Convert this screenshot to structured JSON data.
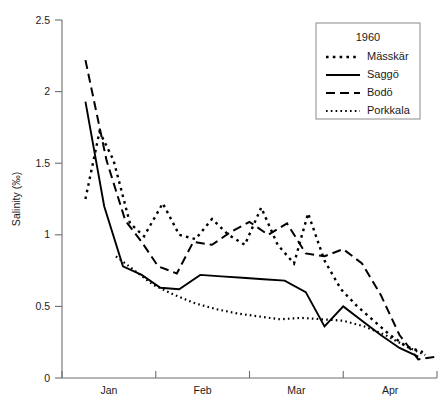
{
  "chart_data": {
    "type": "line",
    "title": "",
    "xlabel": "",
    "ylabel": "Salinity (‰)",
    "ylim": [
      0,
      2.5
    ],
    "yticks": [
      "0",
      "0.5",
      "1",
      "1.5",
      "2",
      "2.5"
    ],
    "ytick_values": [
      0,
      0.5,
      1,
      1.5,
      2,
      2.5
    ],
    "xlim": [
      0,
      16
    ],
    "xtick_labels": [
      "Jan",
      "Feb",
      "Mar",
      "Apr"
    ],
    "xtick_positions": [
      2,
      6,
      10,
      14
    ],
    "xtick_boundaries": [
      0,
      4,
      8,
      12,
      16
    ],
    "grid": false,
    "legend_position": "top-right",
    "legend_title": "1960",
    "series": [
      {
        "name": "Mässkär",
        "style": "dotted-coarse",
        "x": [
          1.0,
          1.6,
          2.2,
          2.9,
          3.5,
          4.3,
          5.0,
          5.7,
          6.4,
          7.1,
          7.8,
          8.5,
          9.2,
          9.9,
          10.5,
          11.2,
          11.9,
          12.6,
          13.3,
          14.0,
          14.7,
          15.4
        ],
        "values": [
          1.25,
          1.72,
          1.52,
          1.08,
          0.99,
          1.22,
          1.0,
          0.97,
          1.11,
          1.0,
          0.93,
          1.19,
          0.93,
          0.8,
          1.15,
          0.82,
          0.62,
          0.5,
          0.4,
          0.3,
          0.22,
          0.18
        ]
      },
      {
        "name": "Saggö",
        "style": "solid",
        "x": [
          1.0,
          1.8,
          2.6,
          3.4,
          4.2,
          5.0,
          5.9,
          6.8,
          7.7,
          8.6,
          9.5,
          10.4,
          11.2,
          12.0,
          12.8,
          13.6,
          14.4,
          15.2
        ],
        "values": [
          1.93,
          1.2,
          0.78,
          0.72,
          0.63,
          0.62,
          0.72,
          0.71,
          0.7,
          0.69,
          0.68,
          0.6,
          0.36,
          0.5,
          0.4,
          0.3,
          0.21,
          0.15
        ]
      },
      {
        "name": "Bodö",
        "style": "dashed",
        "x": [
          1.0,
          1.9,
          2.7,
          3.4,
          4.1,
          4.9,
          5.6,
          6.4,
          7.2,
          8.0,
          8.8,
          9.6,
          10.4,
          11.2,
          12.0,
          12.8,
          13.6,
          14.4,
          15.2,
          16.0
        ],
        "values": [
          2.22,
          1.52,
          1.1,
          0.95,
          0.78,
          0.73,
          0.95,
          0.93,
          1.02,
          1.09,
          1.0,
          1.08,
          0.87,
          0.85,
          0.9,
          0.8,
          0.58,
          0.3,
          0.13,
          0.15
        ]
      },
      {
        "name": "Porkkala",
        "style": "dotted-fine",
        "x": [
          2.3,
          3.1,
          3.9,
          4.8,
          5.7,
          6.6,
          7.5,
          8.4,
          9.3,
          10.2,
          11.1,
          12.0,
          12.9,
          13.8,
          14.7,
          15.5
        ],
        "values": [
          0.85,
          0.75,
          0.65,
          0.58,
          0.52,
          0.48,
          0.45,
          0.43,
          0.41,
          0.42,
          0.41,
          0.4,
          0.36,
          0.3,
          0.22,
          0.16
        ]
      }
    ]
  },
  "legend": {
    "title": "1960",
    "entries": [
      {
        "label": "Mässkär",
        "style": "dotted-coarse"
      },
      {
        "label": "Saggö",
        "style": "solid"
      },
      {
        "label": "Bodö",
        "style": "dashed"
      },
      {
        "label": "Porkkala",
        "style": "dotted-fine"
      }
    ]
  },
  "colors": {
    "line": "#000000",
    "axis": "#6e6e6e",
    "text": "#1a1a1a",
    "background": "#ffffff",
    "legend_border": "#8a8a8a"
  }
}
